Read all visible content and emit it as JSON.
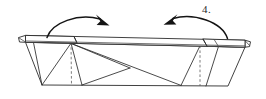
{
  "figure": {
    "kind": "origami-fold-diagram",
    "step_number_label": "4.",
    "background_color": "#ffffff",
    "line_color": "#2b2b2b",
    "crease_color": "#5c5c5c",
    "arrow_color": "#141414",
    "canvas": {
      "width": 266,
      "height": 99
    }
  },
  "parts": {
    "top_band_name": "top-band",
    "left_flap_name": "left-flap",
    "right_flap_name": "right-flap",
    "body_name": "main-body-panel",
    "left_tab_name": "left-end-tab",
    "right_tab_name": "right-end-tab",
    "left_crease_name": "left-dashed-crease",
    "right_crease_name": "right-dashed-crease",
    "left_arrow_name": "left-fold-arrow",
    "right_arrow_name": "right-fold-arrow"
  },
  "geometry": {
    "band_top_left": [
      25,
      35
    ],
    "band_top_right": [
      245,
      40
    ],
    "band_bottom_left": [
      25,
      42
    ],
    "band_bottom_right": [
      245,
      47
    ],
    "body_bottom_left": [
      42,
      85
    ],
    "body_bottom_right": [
      228,
      86
    ],
    "center_crease_x": 71,
    "right_crease_x": 200,
    "inner_vertex": [
      130,
      68
    ]
  }
}
